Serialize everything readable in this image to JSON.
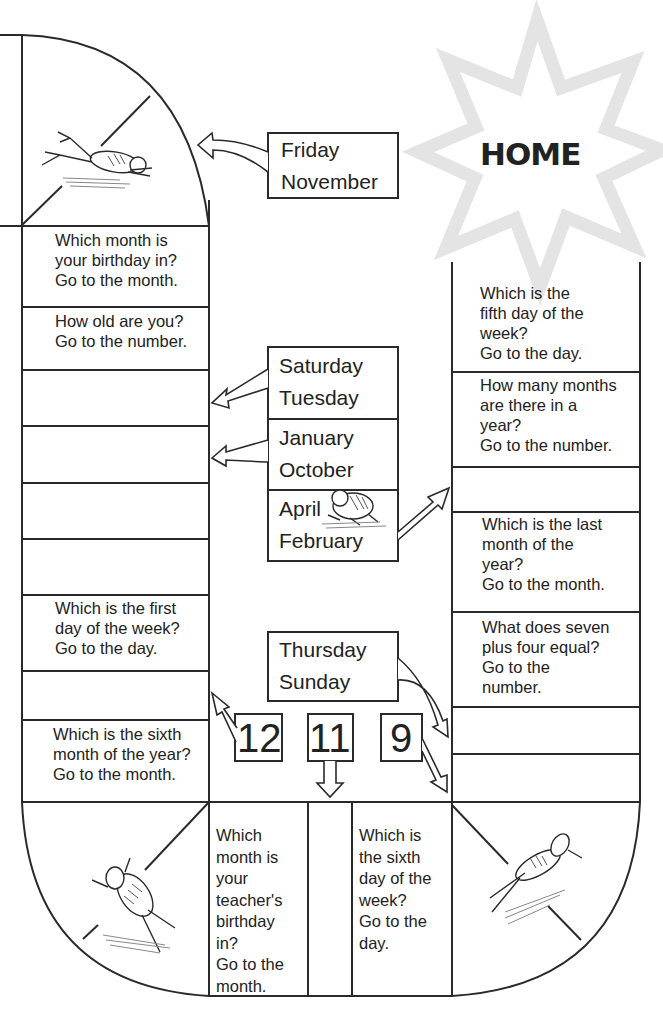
{
  "home": {
    "label": "HOME"
  },
  "left_column": {
    "squares": [
      {
        "text": "Which month is\nyour birthday in?\nGo to the month."
      },
      {
        "text": "How old are you?\nGo to the number."
      },
      {
        "text": ""
      },
      {
        "text": ""
      },
      {
        "text": ""
      },
      {
        "text": ""
      },
      {
        "text": "Which is the first\nday of the week?\nGo to the day."
      },
      {
        "text": ""
      },
      {
        "text": "Which is the sixth\nmonth of the year?\nGo to the month."
      }
    ]
  },
  "right_column": {
    "squares": [
      {
        "text": "Which is the\nfifth day of the\nweek?\nGo to the day."
      },
      {
        "text": "How many months\nare there in a\nyear?\nGo to the number."
      },
      {
        "text": ""
      },
      {
        "text": "Which is the last\nmonth of the\nyear?\nGo to the month."
      },
      {
        "text": "What does seven\nplus four equal?\nGo to the\nnumber."
      },
      {
        "text": ""
      },
      {
        "text": ""
      }
    ]
  },
  "bottom_row": {
    "squares": [
      {
        "text": "Which\nmonth is\nyour\nteacher's\nbirthday\nin?\nGo to the\nmonth."
      },
      {
        "text": ""
      },
      {
        "text": "Which is\nthe sixth\nday of the\nweek?\nGo to the\nday."
      }
    ]
  },
  "center_boxes": {
    "friday_november": "Friday\nNovember",
    "saturday_tuesday": "Saturday\nTuesday",
    "january_october": "January\nOctober",
    "april_february": "April\nFebruary",
    "thursday_sunday": "Thursday\nSunday"
  },
  "number_boxes": [
    "12",
    "11",
    "9"
  ],
  "icons": {
    "frogs": [
      "frog-top-left",
      "frog-center",
      "frog-bottom-left",
      "frog-bottom-right"
    ],
    "star": "home-star"
  },
  "colors": {
    "line": "#2a2a2a",
    "star": "#e6e6e6",
    "background": "#ffffff"
  }
}
